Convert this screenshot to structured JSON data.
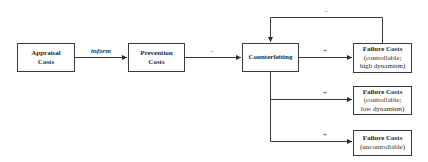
{
  "nodes": {
    "appraisal": {
      "line1": "Appraisal",
      "line2": "Costs"
    },
    "prevention": {
      "line1": "Prevention",
      "line2": "Costs"
    },
    "counterfeiting": {
      "line1": "Counterfeiting"
    },
    "failure_high": {
      "title": "Failure Costs",
      "line2": "(controllable;",
      "line3": "high dynamism)"
    },
    "failure_low": {
      "title": "Failure Costs",
      "line2": "(controllable;",
      "line3": "low dynamism)"
    },
    "failure_unc": {
      "title": "Failure Costs",
      "line2": "(uncontrollable)"
    }
  },
  "edges": {
    "appraisal_to_prevention": "inform",
    "prevention_to_counterfeiting": "–",
    "counterfeiting_to_failure_high": "+",
    "counterfeiting_to_failure_low": "+",
    "counterfeiting_to_failure_unc": "+",
    "failure_high_feedback": "–"
  },
  "colors": {
    "line": "#3a3a3a",
    "text": "#2a2a2a",
    "background": "#ffffff"
  }
}
